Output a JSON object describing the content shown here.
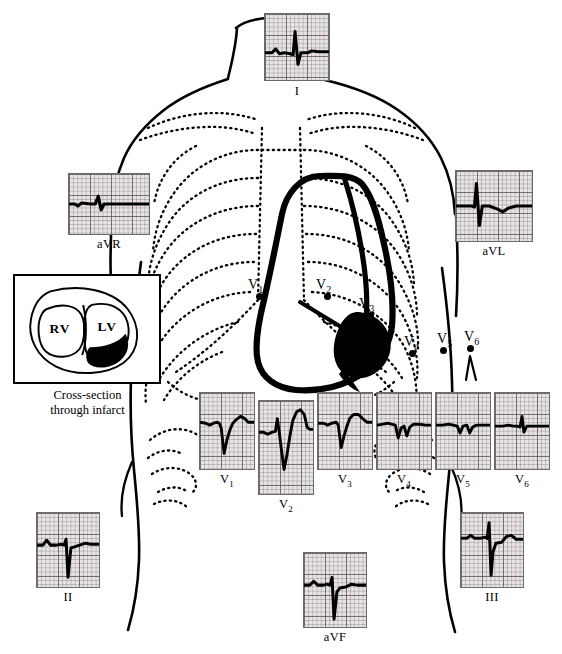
{
  "figure": {
    "type": "anterior-myocardial-infarction-ecg-lead-diagram"
  },
  "inset": {
    "right_ventricle_label": "RV",
    "left_ventricle_label": "LV",
    "caption_line1": "Cross-section",
    "caption_line2": "through infarct",
    "infarct_fill": "#000000"
  },
  "electrodes": [
    {
      "name": "V1",
      "base": "V",
      "sub": "1",
      "x": 259,
      "y": 296,
      "label_x": 248,
      "label_y": 277
    },
    {
      "name": "V2",
      "base": "V",
      "sub": "2",
      "x": 327,
      "y": 296,
      "label_x": 316,
      "label_y": 277
    },
    {
      "name": "V3",
      "base": "V",
      "sub": "3",
      "x": 370,
      "y": 315,
      "label_x": 359,
      "label_y": 296
    },
    {
      "name": "V4",
      "base": "V",
      "sub": "4",
      "x": 412,
      "y": 353,
      "label_x": 404,
      "label_y": 334
    },
    {
      "name": "V5",
      "base": "V",
      "sub": "5",
      "x": 443,
      "y": 350,
      "label_x": 437,
      "label_y": 331
    },
    {
      "name": "V6",
      "base": "V",
      "sub": "6",
      "x": 470,
      "y": 348,
      "label_x": 464,
      "label_y": 329
    }
  ],
  "leads": [
    {
      "id": "I",
      "base": "I",
      "sub": "",
      "x": 264,
      "y": 13,
      "w": 66,
      "h": 68,
      "label_top": 69,
      "trace": "M0,40 L7,40 L11,36 L15,41 L20,40 L26,41 L29,42 L31,18 L34,52 L37,40 L44,40 L48,38 L55,39 L66,39",
      "sw": 3.1
    },
    {
      "id": "aVR",
      "base": "aVR",
      "sub": "",
      "x": 68,
      "y": 173,
      "w": 82,
      "h": 62,
      "label_top": 62,
      "trace": "M0,31 L6,31 L9,33 L13,30 L22,31 L27,31 L30,23 L33,37 L36,31 L44,31 L52,31 L60,31 L70,31 L82,31",
      "sw": 3.3
    },
    {
      "id": "aVL",
      "base": "aVL",
      "sub": "",
      "x": 455,
      "y": 170,
      "w": 78,
      "h": 72,
      "label_top": 72,
      "trace": "M0,36 L10,36 L16,36 L19,37 L21,13 L24,56 L27,36 L34,36 L42,39 L48,42 L54,38 L62,36 L78,36",
      "sw": 3.2
    },
    {
      "id": "V1",
      "base": "V",
      "sub": "1",
      "x": 199,
      "y": 392,
      "w": 56,
      "h": 78,
      "label_top": 78,
      "trace": "M0,30 L6,31 L10,33 L14,31 L18,30 L20,31 L22,36 L25,62 L28,48 L31,38 L34,31 L38,27 L42,24 L46,26 L50,30 L56,30",
      "sw": 3.0
    },
    {
      "id": "V2",
      "base": "V",
      "sub": "2",
      "x": 258,
      "y": 400,
      "w": 56,
      "h": 95,
      "label_top": 95,
      "trace": "M0,32 L5,32 L9,34 L13,32 L17,31 L19,18 L21,32 L23,48 L26,70 L29,55 L32,36 L35,20 L39,11 L43,9 L47,14 L50,27 L53,29 L56,29",
      "sw": 3.0
    },
    {
      "id": "V3",
      "base": "V",
      "sub": "3",
      "x": 317,
      "y": 392,
      "w": 56,
      "h": 78,
      "label_top": 78,
      "trace": "M0,31 L6,31 L10,33 L14,31 L19,30 L21,33 L24,56 L27,44 L30,34 L33,26 L37,22 L42,22 L47,27 L51,30 L56,30",
      "sw": 3.0
    },
    {
      "id": "V4",
      "base": "V",
      "sub": "4",
      "x": 376,
      "y": 392,
      "w": 56,
      "h": 78,
      "label_top": 78,
      "trace": "M0,33 L6,32 L11,31 L15,32 L19,33 L22,46 L25,36 L28,34 L31,44 L34,35 L38,32 L44,32 L50,33 L56,33",
      "sw": 3.0
    },
    {
      "id": "V5",
      "base": "V",
      "sub": "5",
      "x": 435,
      "y": 392,
      "w": 56,
      "h": 78,
      "label_top": 78,
      "trace": "M0,33 L7,33 L13,32 L18,33 L22,34 L25,41 L28,34 L32,33 L35,41 L38,35 L42,33 L48,33 L56,33",
      "sw": 3.0
    },
    {
      "id": "V6",
      "base": "V",
      "sub": "6",
      "x": 494,
      "y": 392,
      "w": 56,
      "h": 78,
      "label_top": 78,
      "trace": "M0,34 L8,34 L14,33 L19,34 L23,34 L26,35 L28,24 L30,40 L33,34 L38,34 L45,34 L52,34 L56,34",
      "sw": 3.0
    },
    {
      "id": "II",
      "base": "II",
      "sub": "",
      "x": 36,
      "y": 512,
      "w": 64,
      "h": 76,
      "label_top": 76,
      "trace": "M0,33 L6,33 L10,28 L14,33 L20,33 L25,32 L28,33 L30,27 L32,66 L35,36 L38,35 L44,33 L50,31 L56,32 L64,32",
      "sw": 3.1
    },
    {
      "id": "III",
      "base": "III",
      "sub": "",
      "x": 460,
      "y": 512,
      "w": 64,
      "h": 76,
      "label_top": 76,
      "trace": "M0,26 L6,26 L10,23 L14,26 L20,26 L25,25 L27,26 L29,10 L31,64 L33,40 L36,31 L42,30 L47,24 L52,23 L57,27 L64,27",
      "sw": 3.1
    },
    {
      "id": "aVF",
      "base": "aVF",
      "sub": "",
      "x": 303,
      "y": 552,
      "w": 64,
      "h": 76,
      "label_top": 76,
      "trace": "M0,33 L6,33 L10,29 L14,33 L20,33 L24,32 L27,33 L29,25 L31,68 L34,40 L37,36 L43,35 L49,32 L55,33 L64,33",
      "sw": 3.1
    }
  ]
}
